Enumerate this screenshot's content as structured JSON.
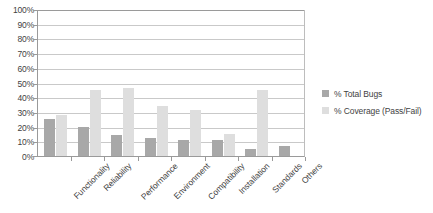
{
  "chart_data": {
    "type": "bar",
    "title": "",
    "subtitle": "",
    "xlabel": "",
    "ylabel": "",
    "ylim": [
      0,
      100
    ],
    "grid": true,
    "legend_position": "right",
    "categories": [
      "Functionality",
      "Reliability",
      "Performance",
      "Environment",
      "Compatibility",
      "Installation",
      "Standards",
      "Others"
    ],
    "ytick_labels": [
      "100%",
      "90%",
      "80%",
      "70%",
      "60%",
      "50%",
      "40%",
      "30%",
      "20%",
      "10%",
      "0%"
    ],
    "ytick_values": [
      100,
      90,
      80,
      70,
      60,
      50,
      40,
      30,
      20,
      10,
      0
    ],
    "series": [
      {
        "name": "% Total Bugs",
        "color": "#a8a8a8",
        "values": [
          25,
          20,
          14,
          12,
          11,
          11,
          5,
          7
        ]
      },
      {
        "name": "% Coverage (Pass/Fail)",
        "color": "#dedede",
        "values": [
          28,
          45,
          46,
          34,
          31,
          15,
          45,
          0
        ]
      }
    ]
  }
}
